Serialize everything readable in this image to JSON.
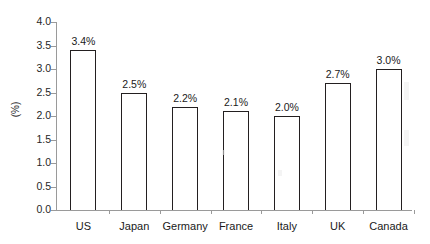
{
  "chart_data": {
    "type": "bar",
    "title": "",
    "xlabel": "",
    "ylabel": "(%)",
    "categories": [
      "US",
      "Japan",
      "Germany",
      "France",
      "Italy",
      "UK",
      "Canada"
    ],
    "values": [
      3.4,
      2.5,
      2.2,
      2.1,
      2.0,
      2.7,
      3.0
    ],
    "value_labels": [
      "3.4%",
      "2.5%",
      "2.2%",
      "2.1%",
      "2.0%",
      "2.7%",
      "3.0%"
    ],
    "ylim": [
      0.0,
      4.0
    ],
    "ytick_labels": [
      "0.0",
      "0.5",
      "1.0",
      "1.5",
      "2.0",
      "2.5",
      "3.0",
      "3.5",
      "4.0"
    ],
    "ytick_values": [
      0.0,
      0.5,
      1.0,
      1.5,
      2.0,
      2.5,
      3.0,
      3.5,
      4.0
    ],
    "grid": false,
    "legend": false,
    "legend_position": "none",
    "series": [
      {
        "name": "",
        "values": [
          3.4,
          2.5,
          2.2,
          2.1,
          2.0,
          2.7,
          3.0
        ]
      }
    ],
    "colors": {
      "bar_fill": "#ffffff",
      "bar_stroke": "#231f20",
      "axis": "#9a9a9a",
      "text": "#1a1a1a",
      "background": "#ffffff"
    }
  }
}
